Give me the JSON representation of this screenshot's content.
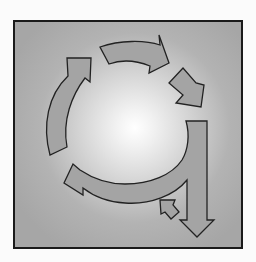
{
  "diagram": {
    "type": "cycle",
    "colors": {
      "background": "#fbfbfb",
      "frame_border": "#1a1a1a",
      "gradient_center": "#ffffff",
      "gradient_edge": "#a6a6a6",
      "arrow_fill": "#a4a4a4",
      "arrow_stroke": "#222222"
    },
    "arrows": [
      {
        "id": "left-arc-arrow",
        "direction": "up-right"
      },
      {
        "id": "top-arc-arrow",
        "direction": "right"
      },
      {
        "id": "right-short-arrow",
        "direction": "down-right"
      },
      {
        "id": "down-exit-arrow",
        "direction": "down"
      },
      {
        "id": "bottom-arc-arrow",
        "direction": "up-left"
      },
      {
        "id": "small-return-arrow",
        "direction": "up-left"
      }
    ]
  }
}
